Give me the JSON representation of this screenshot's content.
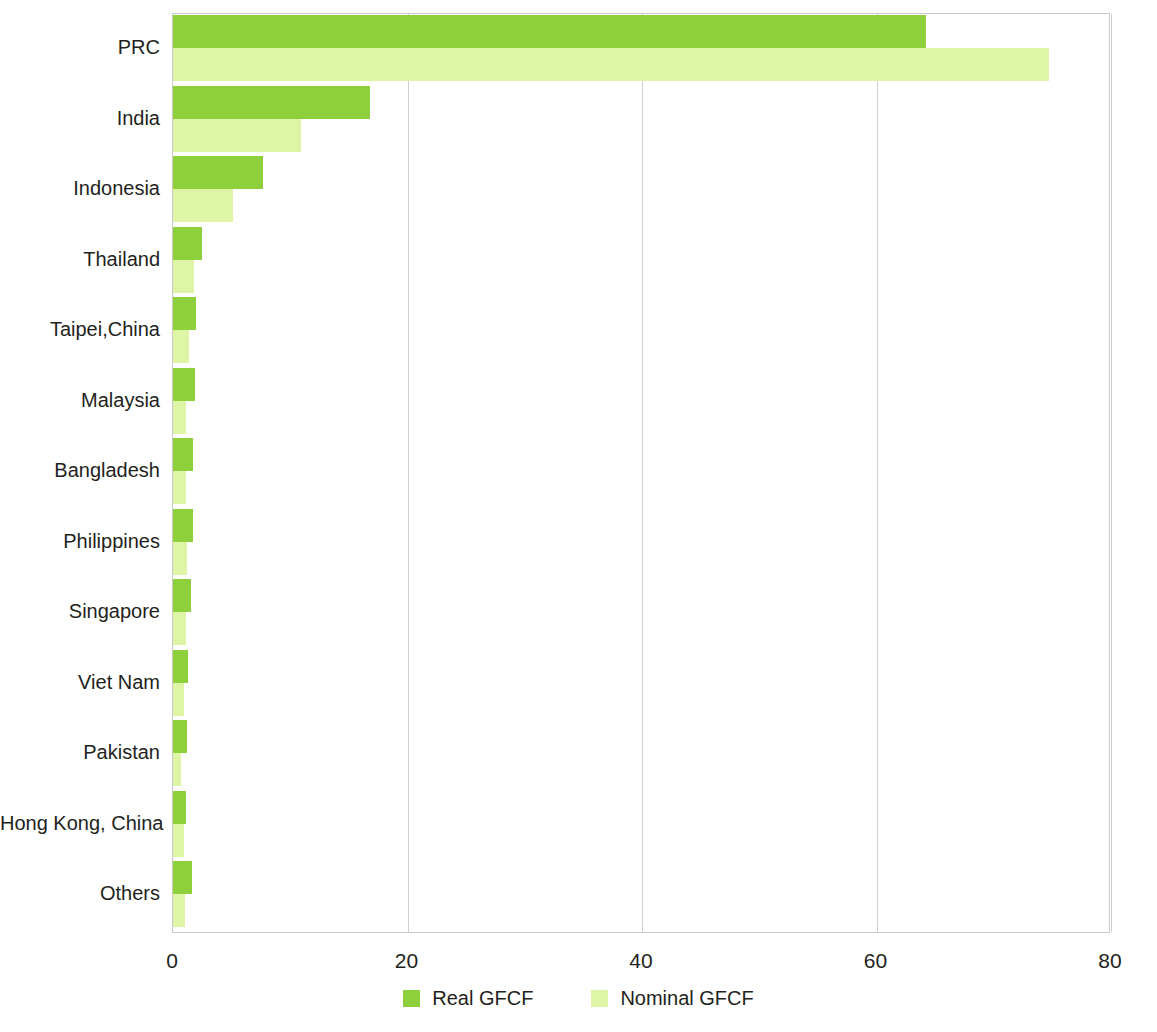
{
  "chart_data": {
    "type": "bar",
    "orientation": "horizontal",
    "title": "",
    "subtitle": "",
    "xlabel": "",
    "ylabel": "",
    "xlim": [
      0,
      80
    ],
    "xticks": [
      0,
      20,
      40,
      60,
      80
    ],
    "xtick_labels": [
      "0",
      "20",
      "40",
      "60",
      "80"
    ],
    "grid": "vertical",
    "legend_position": "bottom-center",
    "categories": [
      "PRC",
      "India",
      "Indonesia",
      "Thailand",
      "Taipei,China",
      "Malaysia",
      "Bangladesh",
      "Philippines",
      "Singapore",
      "Viet Nam",
      "Pakistan",
      "Hong Kong, China",
      "Others"
    ],
    "series": [
      {
        "name": "Real GFCF",
        "color": "#8ed03c",
        "values": [
          64.2,
          16.8,
          7.7,
          2.5,
          2.0,
          1.9,
          1.7,
          1.7,
          1.5,
          1.3,
          1.2,
          1.1,
          1.6
        ]
      },
      {
        "name": "Nominal GFCF",
        "color": "#ddf5a5",
        "values": [
          74.7,
          10.9,
          5.1,
          1.8,
          1.4,
          1.1,
          1.1,
          1.2,
          1.1,
          0.9,
          0.7,
          0.9,
          1.0
        ]
      }
    ]
  },
  "legend": {
    "items": [
      {
        "label": "Real GFCF",
        "swatch": "real"
      },
      {
        "label": "Nominal GFCF",
        "swatch": "nominal"
      }
    ]
  },
  "colors": {
    "real": "#8ed03c",
    "nominal": "#ddf5a5",
    "axis": "#c9c9c9",
    "grid": "#cfcfcf",
    "text": "#231f20",
    "background": "#ffffff"
  }
}
